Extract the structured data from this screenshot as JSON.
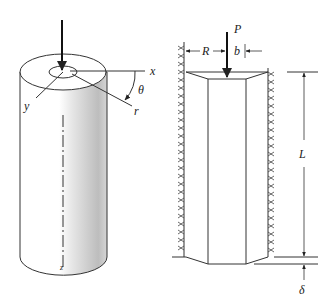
{
  "figure_left": {
    "title": "Cylinder with coordinate axes",
    "labels": {
      "x": "x",
      "y": "y",
      "r": "r",
      "theta": "θ",
      "z": "z"
    }
  },
  "figure_right": {
    "title": "Column between rigid walls",
    "labels": {
      "P": "P",
      "R": "R",
      "b": "b",
      "L": "L",
      "delta": "δ"
    }
  },
  "colors": {
    "line": "#222222",
    "shade_dark": "#b8b8b8",
    "shade_light": "#ffffff"
  }
}
